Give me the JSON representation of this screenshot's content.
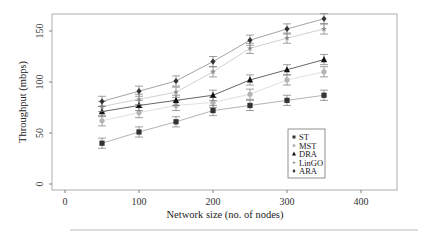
{
  "chart_data": {
    "type": "line",
    "title": "",
    "xlabel": "Network size (no. of nodes)",
    "ylabel": "Throughput (mbps)",
    "xlim": [
      -15,
      470
    ],
    "ylim": [
      -5,
      167
    ],
    "xticks": [
      0,
      100,
      200,
      300,
      400
    ],
    "yticks": [
      0,
      50,
      100,
      150
    ],
    "grid": false,
    "legend_position": "bottom-right",
    "x": [
      50,
      100,
      150,
      200,
      250,
      300,
      350
    ],
    "error_bar": 5,
    "series": [
      {
        "name": "ST",
        "marker": "square",
        "color": "#333333",
        "line": "#aaaaaa",
        "values": [
          40,
          51,
          61,
          72,
          77,
          82,
          87
        ]
      },
      {
        "name": "MST",
        "marker": "circle",
        "color": "#b5b5b5",
        "line": "#dddddd",
        "values": [
          62,
          70,
          77,
          80,
          88,
          102,
          110
        ]
      },
      {
        "name": "DRA",
        "marker": "triangle",
        "color": "#111111",
        "line": "#555555",
        "values": [
          71,
          77,
          82,
          87,
          102,
          112,
          122
        ]
      },
      {
        "name": "LinGO",
        "marker": "star",
        "color": "#888888",
        "line": "#cccccc",
        "values": [
          76,
          83,
          90,
          110,
          133,
          143,
          152
        ]
      },
      {
        "name": "ARA",
        "marker": "diamond",
        "color": "#333333",
        "line": "#999999",
        "values": [
          81,
          91,
          101,
          120,
          141,
          152,
          162
        ]
      }
    ]
  }
}
